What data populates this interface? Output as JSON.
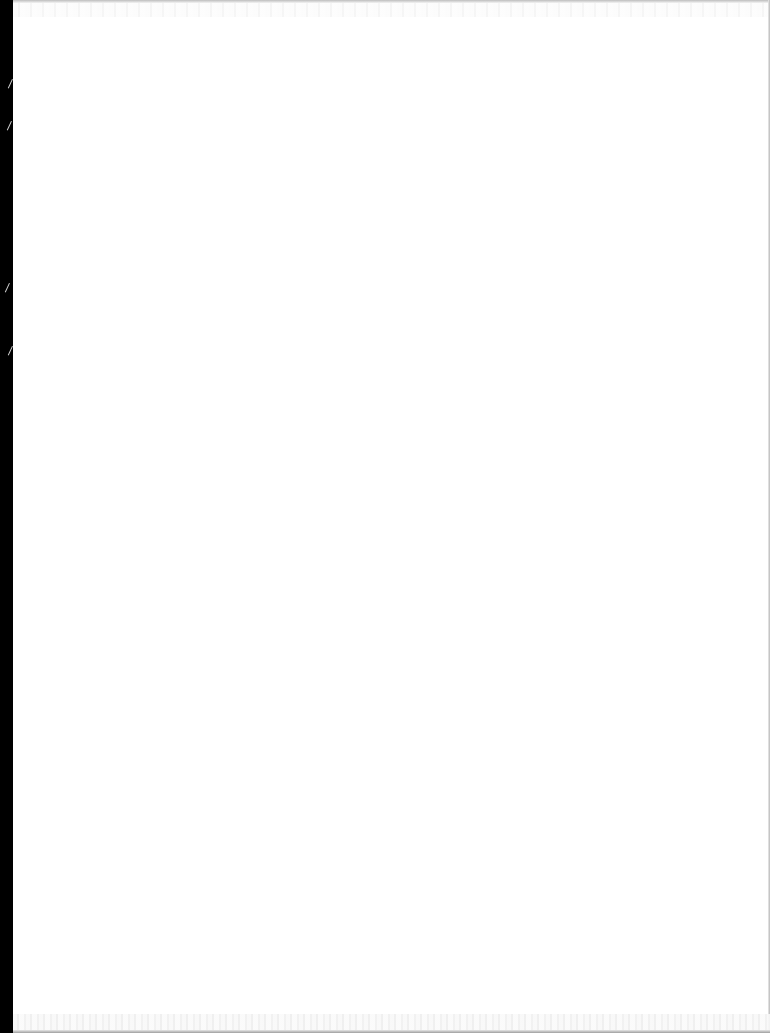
{
  "document": {
    "type": "scanned-page",
    "content": "",
    "colors": {
      "page_background": "#ffffff",
      "scanner_edge": "#000000",
      "edge_shadow": "#b8b8b8"
    }
  }
}
